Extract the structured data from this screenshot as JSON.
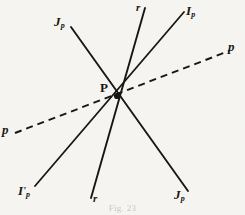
{
  "figure": {
    "caption": "Fig. 23",
    "background_color": "#fbfbf9",
    "ink_color": "#191713",
    "center_point": {
      "label": "P",
      "x": 117,
      "y": 96
    },
    "labels": [
      {
        "id": "jp-top",
        "base": "J",
        "prime": "",
        "sub": "p",
        "x": 54,
        "y": 15
      },
      {
        "id": "r-top",
        "base": "r",
        "prime": "",
        "sub": "",
        "x": 136,
        "y": 2
      },
      {
        "id": "ip-top",
        "base": "I",
        "prime": "",
        "sub": "p",
        "x": 186,
        "y": 4
      },
      {
        "id": "p-right",
        "base": "p",
        "prime": "",
        "sub": "",
        "x": 228,
        "y": 40
      },
      {
        "id": "p-left",
        "base": "p",
        "prime": "",
        "sub": "",
        "x": 2,
        "y": 123
      },
      {
        "id": "ip-prime-bottom",
        "base": "I",
        "prime": "'",
        "sub": "p",
        "x": 18,
        "y": 184
      },
      {
        "id": "r-bottom",
        "base": "r",
        "prime": "",
        "sub": "",
        "x": 93,
        "y": 193
      },
      {
        "id": "jp-bottom",
        "base": "J",
        "prime": "",
        "sub": "p",
        "x": 174,
        "y": 188
      }
    ],
    "lines": [
      {
        "id": "line-jp",
        "style": "solid",
        "endpoint_labels": [
          "J_p",
          "J_p"
        ],
        "from": {
          "x": 71,
          "y": 27
        },
        "to": {
          "x": 188,
          "y": 191
        }
      },
      {
        "id": "line-r",
        "style": "solid",
        "endpoint_labels": [
          "r",
          "r"
        ],
        "from": {
          "x": 145,
          "y": 8
        },
        "to": {
          "x": 91,
          "y": 198
        }
      },
      {
        "id": "line-ip",
        "style": "solid",
        "endpoint_labels": [
          "I_p",
          "I'_p"
        ],
        "from": {
          "x": 184,
          "y": 12
        },
        "to": {
          "x": 35,
          "y": 186
        }
      },
      {
        "id": "line-p-dashed",
        "style": "dashed",
        "endpoint_labels": [
          "p",
          "p"
        ],
        "from": {
          "x": 15,
          "y": 133
        },
        "to": {
          "x": 229,
          "y": 51
        }
      }
    ]
  }
}
